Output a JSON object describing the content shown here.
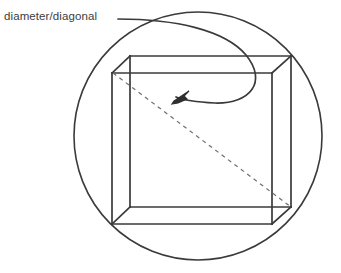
{
  "figure": {
    "kind": "geometry-diagram",
    "background_color": "#ffffff",
    "stroke_color": "#3a3a3a",
    "thin_stroke_color": "#4a4a4a",
    "dashed_stroke_color": "#6e6e6e",
    "label": {
      "text": "diameter/diagonal",
      "color": "#3c3c3c",
      "font_size_px": 11.5
    },
    "circle": {
      "center_x": 198,
      "center_y": 136,
      "radius": 124,
      "stroke_width": 1.6
    },
    "box": {
      "front_face": {
        "left_x": 112,
        "right_x": 272,
        "top_y": 73,
        "bottom_y": 224
      },
      "back_face": {
        "left_x": 130,
        "right_x": 291,
        "top_y": 56,
        "bottom_y": 207
      },
      "stroke_width": 1.7
    },
    "dashed_diagonal": {
      "from_x": 113,
      "from_y": 73,
      "to_x": 291,
      "to_y": 207,
      "dash_pattern": "4 4",
      "stroke_width": 1.2
    },
    "leader_line": {
      "start_x": 118,
      "start_y": 19,
      "end_x": 177,
      "end_y": 96,
      "arrowhead": {
        "tip_x": 175,
        "tip_y": 100,
        "direction": "down-left"
      },
      "stroke_width": 1.7
    }
  }
}
